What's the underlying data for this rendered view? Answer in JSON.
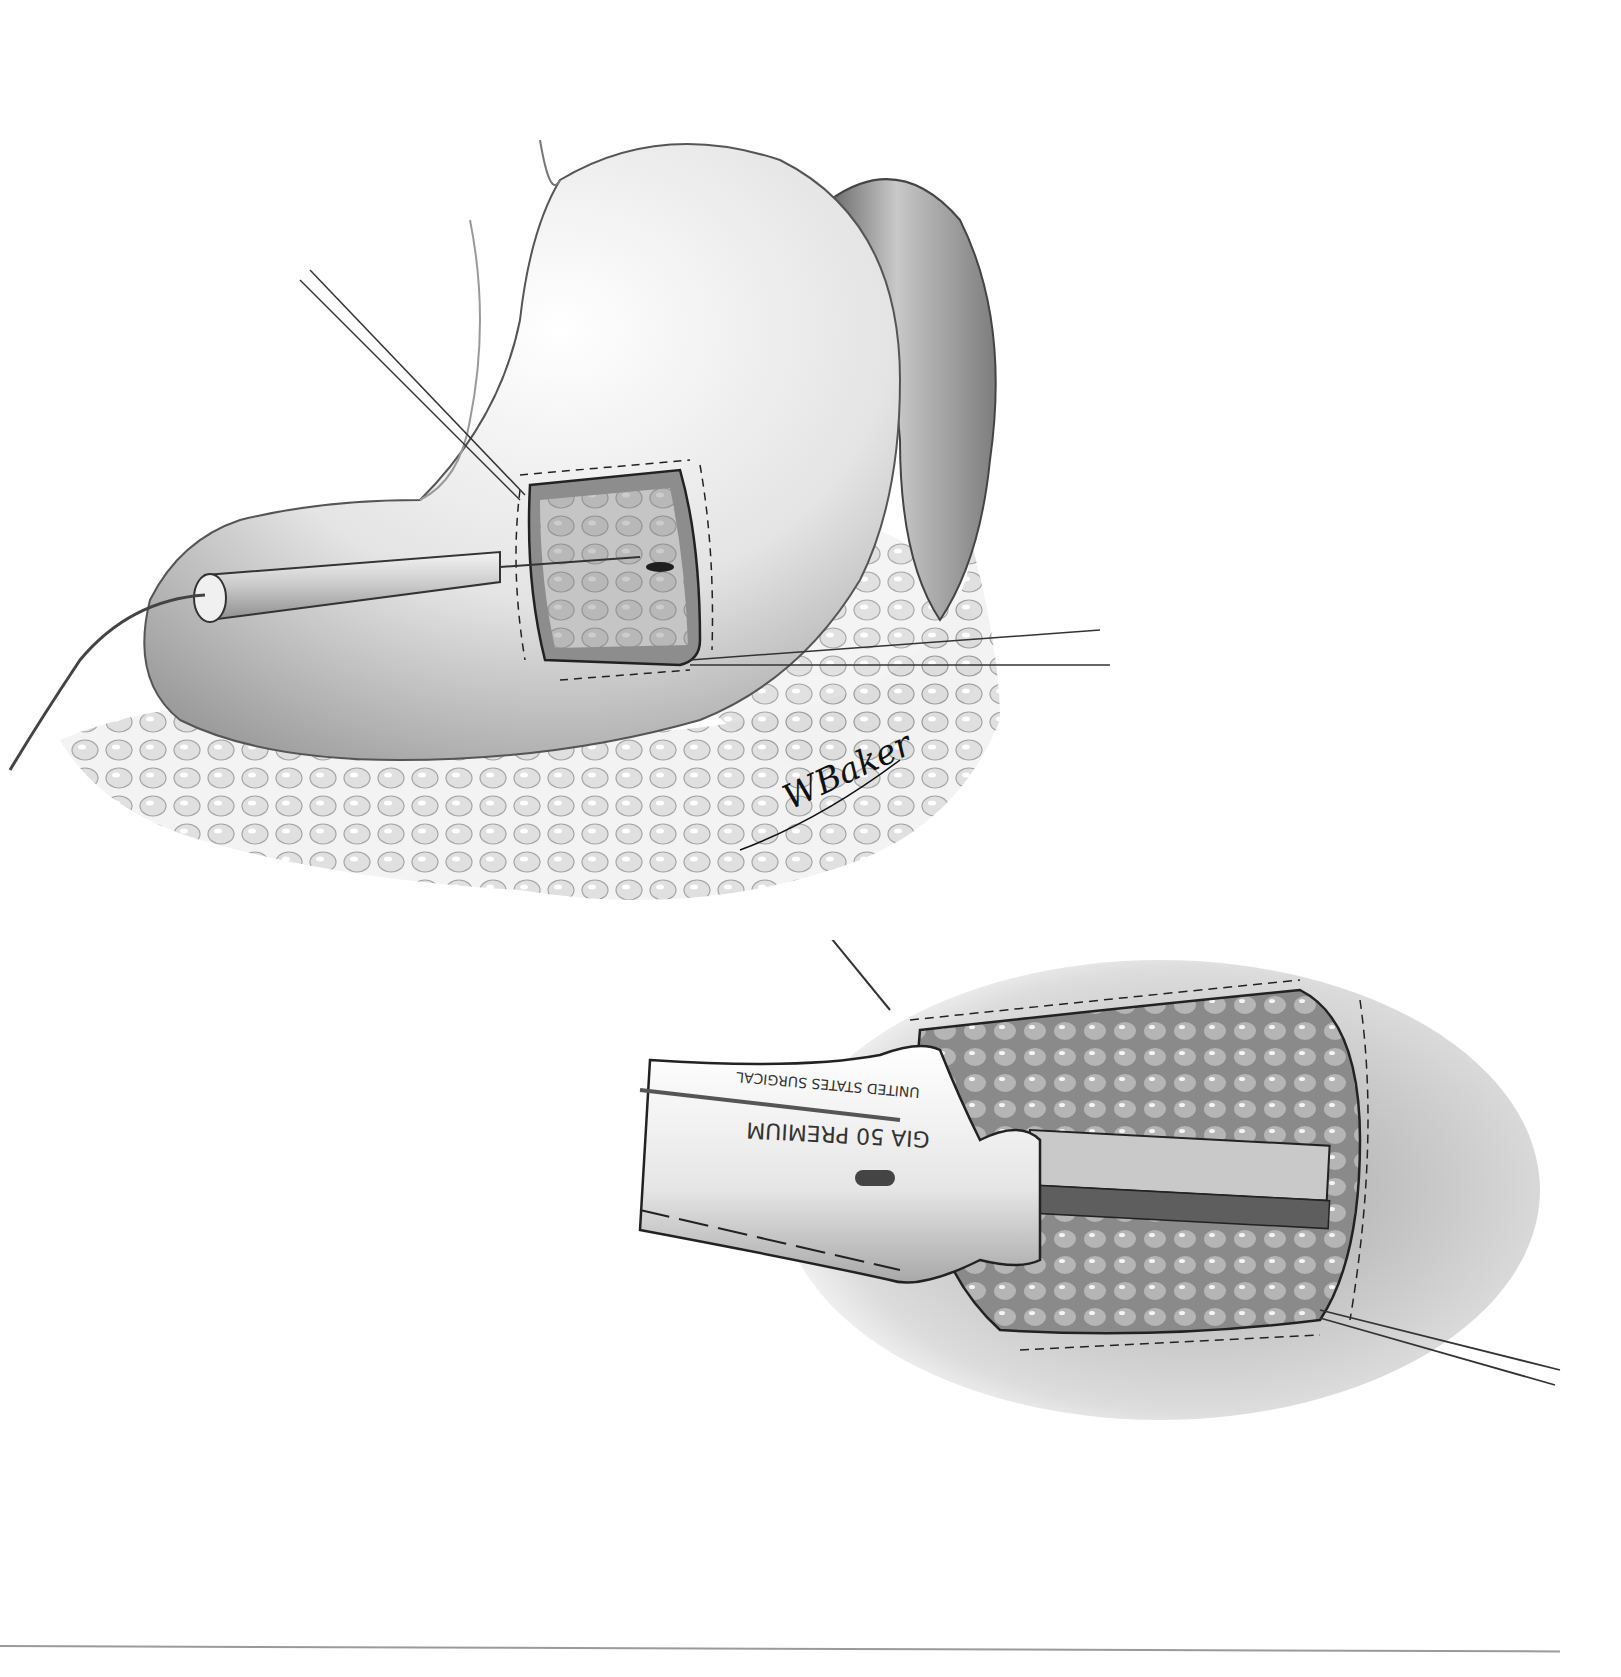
{
  "figure": {
    "type": "surgical-illustration",
    "style": "grayscale pencil/airbrush medical illustration",
    "panels": [
      {
        "id": "top",
        "subject": "stomach with anterior gastrotomy held open by traction sutures; cautery probe inserted into opening; omentum below",
        "elements": [
          "stomach",
          "spleen",
          "omentum",
          "gastrotomy-opening",
          "traction-suture-upper",
          "traction-suture-right",
          "electrocautery-probe",
          "probe-cable"
        ]
      },
      {
        "id": "bottom",
        "subject": "linear stapler inserted through gastrotomy, traction suture at right corner",
        "elements": [
          "linear-stapler",
          "stapler-cartridge",
          "gastrotomy-edge",
          "traction-suture-top",
          "traction-suture-bottom-right"
        ],
        "stapler_label_line1": "UNITED STATES SURGICAL",
        "stapler_label_line2": "GIA 50 PREMIUM"
      }
    ],
    "signature": "WBaker"
  },
  "colors": {
    "background": "#ffffff",
    "ink": "#222222",
    "tissue_light": "#e8e8e8",
    "tissue_mid": "#bdbdbd",
    "tissue_dark": "#6e6e6e",
    "rule": "#9a9a9a"
  }
}
